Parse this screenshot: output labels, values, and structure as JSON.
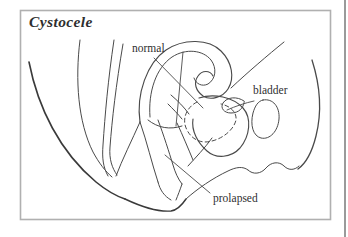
{
  "figure": {
    "title": "Cystocele",
    "labels": {
      "normal": "normal",
      "bladder": "bladder",
      "prolapsed": "prolapsed"
    },
    "colors": {
      "line": "#4a4a4a",
      "line_dark": "#3a3a3a",
      "frame": "#b0b0b0",
      "divider": "#8f8f8f",
      "text": "#2f2f2f",
      "background": "#ffffff"
    }
  }
}
